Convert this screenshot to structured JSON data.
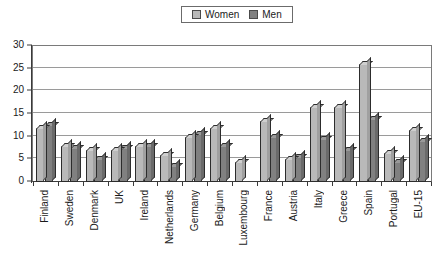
{
  "legend": {
    "entries": [
      {
        "label": "Women",
        "color": "#b9b9b9",
        "icon": "legend-swatch-women"
      },
      {
        "label": "Men",
        "color": "#808080",
        "icon": "legend-swatch-men"
      }
    ]
  },
  "axes": {
    "y_ticks": [
      "0",
      "5",
      "10",
      "15",
      "20",
      "25",
      "30"
    ]
  },
  "chart_data": {
    "type": "bar",
    "title": "",
    "subtitle": "",
    "xlabel": "",
    "ylabel": "",
    "ylim": [
      0,
      30
    ],
    "ytick_step": 5,
    "grid": true,
    "legend_position": "top-center",
    "orientation": "vertical",
    "grouping": "clustered",
    "categories": [
      "Finland",
      "Sweden",
      "Denmark",
      "UK",
      "Ireland",
      "Netherlands",
      "Germany",
      "Belgium",
      "Luxembourg",
      "France",
      "Austria",
      "Italy",
      "Greece",
      "Spain",
      "Portugal",
      "EU-15"
    ],
    "series": [
      {
        "name": "Women",
        "color": "#b9b9b9",
        "values": [
          12.0,
          8.0,
          7.0,
          7.0,
          8.0,
          6.0,
          10.0,
          12.0,
          4.5,
          13.5,
          5.0,
          16.5,
          16.5,
          26.0,
          6.5,
          11.5
        ]
      },
      {
        "name": "Men",
        "color": "#808080",
        "values": [
          12.5,
          7.5,
          5.0,
          7.5,
          8.0,
          3.5,
          10.5,
          8.0,
          0,
          10.0,
          5.5,
          9.5,
          7.0,
          14.0,
          4.5,
          9.0
        ]
      }
    ]
  }
}
